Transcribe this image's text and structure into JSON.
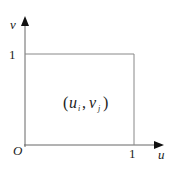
{
  "diagram": {
    "axes": {
      "x_label": "u",
      "y_label": "v",
      "origin_label": "O",
      "x_tick": "1",
      "y_tick": "1"
    },
    "cell_label": {
      "open": "(",
      "u": "u",
      "u_sub": "i",
      "comma": ",",
      "v": "v",
      "v_sub": "j",
      "close": ")"
    },
    "colors": {
      "axis": "#555555",
      "box": "#888888",
      "text": "#222222"
    }
  }
}
